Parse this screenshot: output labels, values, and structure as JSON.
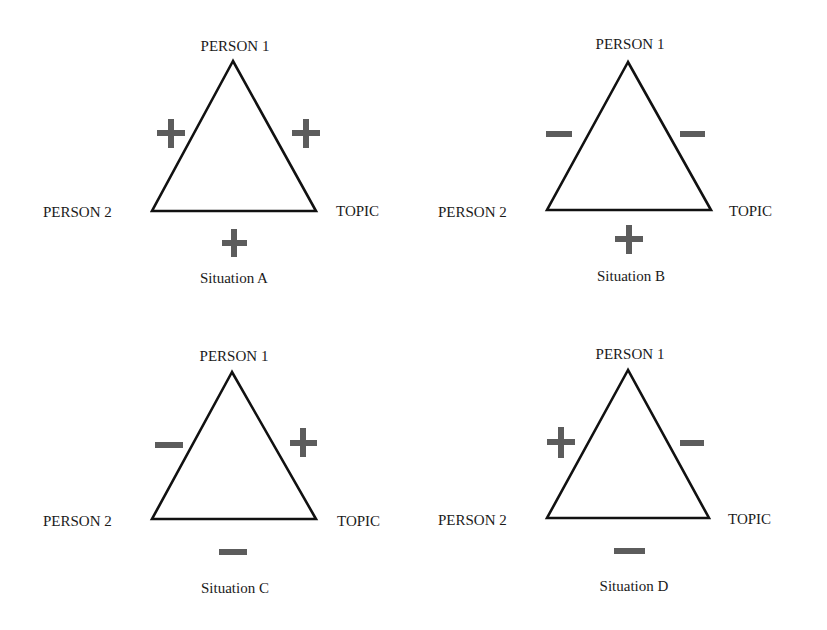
{
  "header_fragment": "p                              pp             p",
  "colors": {
    "line": "#111111",
    "sign": "#5c5c5c",
    "text": "#1a1a1a",
    "background": "#ffffff"
  },
  "diagram": {
    "type": "balance-theory-triangles",
    "node_labels": {
      "apex": "PERSON 1",
      "left": "PERSON 2",
      "right": "TOPIC"
    },
    "situations": [
      {
        "id": "A",
        "caption": "Situation A",
        "person1_person2": "+",
        "person1_topic": "+",
        "person2_topic": "+",
        "labels": {
          "apex": "PERSON 1",
          "left": "PERSON 2",
          "right": "TOPIC"
        }
      },
      {
        "id": "B",
        "caption": "Situation B",
        "person1_person2": "−",
        "person1_topic": "−",
        "person2_topic": "+",
        "labels": {
          "apex": "PERSON 1",
          "left": "PERSON 2",
          "right": "TOPIC"
        }
      },
      {
        "id": "C",
        "caption": "Situation C",
        "person1_person2": "−",
        "person1_topic": "+",
        "person2_topic": "−",
        "labels": {
          "apex": "PERSON 1",
          "left": "PERSON 2",
          "right": "TOPIC"
        }
      },
      {
        "id": "D",
        "caption": "Situation D",
        "person1_person2": "+",
        "person1_topic": "−",
        "person2_topic": "−",
        "labels": {
          "apex": "PERSON 1",
          "left": "PERSON 2",
          "right": "TOPIC"
        }
      }
    ]
  }
}
